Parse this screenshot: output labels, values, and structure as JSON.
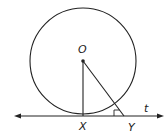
{
  "diagram": {
    "type": "geometry",
    "labels": {
      "center": "O",
      "tangent_point": "X",
      "other_point": "Y",
      "line": "t"
    },
    "colors": {
      "stroke": "#222222",
      "background": "#ffffff"
    }
  }
}
